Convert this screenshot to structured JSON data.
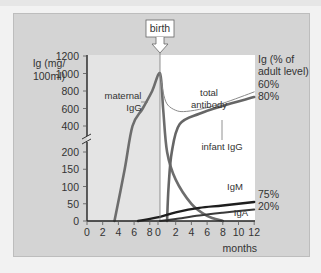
{
  "chart_data": {
    "type": "line",
    "title": "",
    "annotation_birth": "birth",
    "ylabel_left": [
      "Ig (mg/",
      "100ml)"
    ],
    "ylabel_right": [
      "Ig (% of",
      "adult level)"
    ],
    "xlabel": "months",
    "y_axis_break": true,
    "y_ticks_upper": [
      400,
      600,
      800,
      1000,
      1200
    ],
    "y_ticks_lower": [
      0,
      50,
      100,
      150,
      200
    ],
    "x_ticks_prenatal": [
      "0",
      "2",
      "4",
      "6",
      "8"
    ],
    "x_ticks_postnatal": [
      "0",
      "2",
      "4",
      "6",
      "8",
      "10",
      "12"
    ],
    "x_range_prenatal_months": [
      0,
      9
    ],
    "x_range_postnatal_months": [
      0,
      12
    ],
    "right_labels": [
      "60%",
      "80%",
      "75%",
      "20%"
    ],
    "series": [
      {
        "name": "maternal IgG",
        "label": [
          "maternal",
          "IgG"
        ],
        "points": [
          [
            -5.8,
            0
          ],
          [
            -4.5,
            150
          ],
          [
            -3.5,
            400
          ],
          [
            -2.2,
            600
          ],
          [
            -1.0,
            800
          ],
          [
            0,
            1000
          ],
          [
            0.4,
            600
          ],
          [
            0.9,
            200
          ],
          [
            2,
            120
          ],
          [
            4,
            50
          ],
          [
            6,
            15
          ],
          [
            8,
            0
          ]
        ]
      },
      {
        "name": "total antibody",
        "label": [
          "total",
          "antibody"
        ],
        "points": [
          [
            0,
            1000
          ],
          [
            0.5,
            750
          ],
          [
            1,
            640
          ],
          [
            2,
            580
          ],
          [
            3,
            565
          ],
          [
            5,
            590
          ],
          [
            8,
            660
          ],
          [
            12,
            790
          ]
        ]
      },
      {
        "name": "infant IgG",
        "label": [
          "infant IgG"
        ],
        "points": [
          [
            0.9,
            0
          ],
          [
            1.1,
            100
          ],
          [
            1.5,
            200
          ],
          [
            2.5,
            420
          ],
          [
            5,
            540
          ],
          [
            8,
            630
          ],
          [
            12,
            730
          ]
        ]
      },
      {
        "name": "IgM",
        "label": [
          "IgM"
        ],
        "points": [
          [
            -2.8,
            0
          ],
          [
            0,
            12
          ],
          [
            2,
            25
          ],
          [
            5,
            38
          ],
          [
            8,
            45
          ],
          [
            12,
            55
          ]
        ]
      },
      {
        "name": "IgA",
        "label": [
          "IgA"
        ],
        "points": [
          [
            0,
            0
          ],
          [
            2,
            6
          ],
          [
            5,
            16
          ],
          [
            8,
            24
          ],
          [
            12,
            33
          ]
        ]
      }
    ]
  },
  "colors": {
    "frame": "#d4d4d4",
    "prenatal_bg": "#e4e4e4",
    "postnatal_bg": "#ffffff",
    "maternal": "#6d6d6d",
    "total": "#8a8a8a",
    "infant": "#666666",
    "igm": "#1e1e1e",
    "iga": "#3a3a3a"
  }
}
